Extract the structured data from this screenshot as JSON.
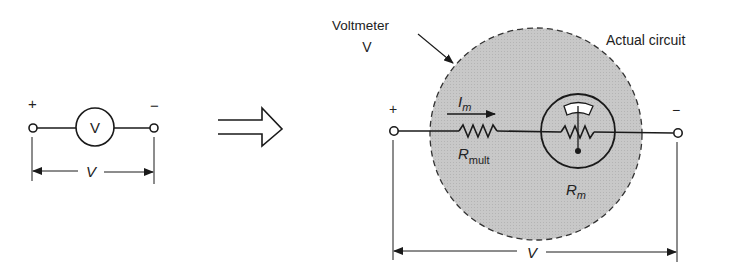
{
  "left_symbol": {
    "plus": "+",
    "minus": "−",
    "meter_letter": "V",
    "voltage_label": "V"
  },
  "arrow": {
    "meaning": "equivalent-to",
    "icon": "double-arrow-right-icon"
  },
  "right_circuit": {
    "voltmeter_label_line1": "Voltmeter",
    "voltmeter_label_line2": "V",
    "actual_circuit_label": "Actual circuit",
    "plus": "+",
    "minus": "−",
    "current_label": "I",
    "current_sub": "m",
    "rmult_label": "R",
    "rmult_sub": "mult",
    "rm_label": "R",
    "rm_sub": "m",
    "voltage_label": "V"
  },
  "colors": {
    "line": "#1a1a1a",
    "shade": "#c4c4c4",
    "background": "#ffffff"
  }
}
